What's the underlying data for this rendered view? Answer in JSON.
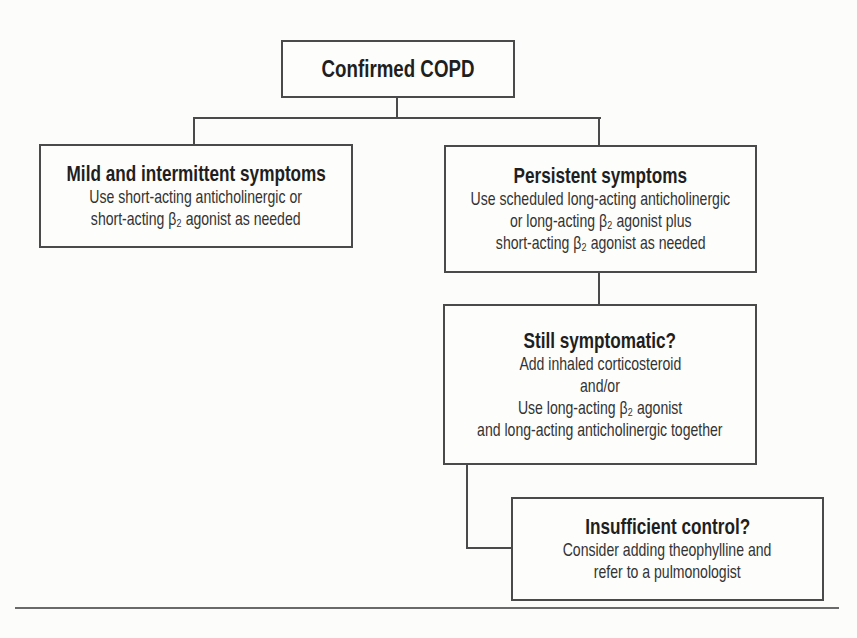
{
  "diagram": {
    "type": "flowchart",
    "nodes": {
      "root": {
        "title": "Confirmed COPD"
      },
      "mild": {
        "title": "Mild and intermittent symptoms",
        "lines": [
          "Use short-acting anticholinergic or",
          "short-acting β₂ agonist as needed"
        ]
      },
      "persistent": {
        "title": "Persistent symptoms",
        "lines": [
          "Use scheduled long-acting anticholinergic",
          "or long-acting β₂ agonist plus",
          "short-acting β₂ agonist as needed"
        ]
      },
      "still": {
        "title": "Still symptomatic?",
        "lines": [
          "Add inhaled corticosteroid",
          "and/or",
          "Use long-acting β₂ agonist",
          "and long-acting anticholinergic together"
        ]
      },
      "insufficient": {
        "title": "Insufficient control?",
        "lines": [
          "Consider adding theophylline and",
          "refer to a pulmonologist"
        ]
      }
    },
    "edges": [
      {
        "from": "Confirmed COPD",
        "to": "Mild and intermittent symptoms"
      },
      {
        "from": "Confirmed COPD",
        "to": "Persistent symptoms"
      },
      {
        "from": "Persistent symptoms",
        "to": "Still symptomatic?"
      },
      {
        "from": "Still symptomatic?",
        "to": "Insufficient control?"
      }
    ],
    "colors": {
      "stroke": "#4a4a4a",
      "text": "#2a2a2a",
      "background": "#fcfcfa"
    }
  }
}
